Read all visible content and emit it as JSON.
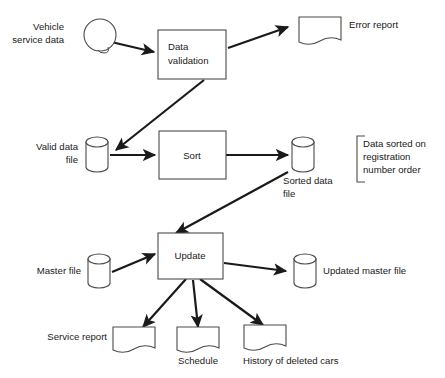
{
  "diagram": {
    "background_color": "#ffffff",
    "line_color": "#1a1a1a",
    "shape_outline_color": "#4a4a4a",
    "nodes": {
      "vehicle_service_data": {
        "label_line1": "Vehicle",
        "label_line2": "service data",
        "shape": "circle"
      },
      "data_validation": {
        "label_line1": "Data",
        "label_line2": "validation",
        "shape": "process-box"
      },
      "error_report": {
        "label": "Error report",
        "shape": "document"
      },
      "valid_data_file": {
        "label_line1": "Valid data",
        "label_line2": "file",
        "shape": "cylinder"
      },
      "sort": {
        "label": "Sort",
        "shape": "process-box"
      },
      "sorted_data_file": {
        "label_line1": "Sorted data",
        "label_line2": "file",
        "shape": "cylinder"
      },
      "annotation_sorted": {
        "label_line1": "Data sorted on",
        "label_line2": "registration",
        "label_line3": "number order",
        "shape": "bracket-note"
      },
      "master_file": {
        "label": "Master file",
        "shape": "cylinder"
      },
      "update": {
        "label": "Update",
        "shape": "process-box"
      },
      "updated_master_file": {
        "label": "Updated master file",
        "shape": "cylinder"
      },
      "service_report": {
        "label": "Service report",
        "shape": "document"
      },
      "schedule": {
        "label": "Schedule",
        "shape": "document"
      },
      "history_of_deleted_cars": {
        "label": "History of deleted cars",
        "shape": "document"
      }
    },
    "edges": [
      {
        "from": "vehicle_service_data",
        "to": "data_validation"
      },
      {
        "from": "data_validation",
        "to": "error_report"
      },
      {
        "from": "data_validation",
        "to": "valid_data_file"
      },
      {
        "from": "valid_data_file",
        "to": "sort"
      },
      {
        "from": "sort",
        "to": "sorted_data_file"
      },
      {
        "from": "sorted_data_file",
        "to": "update"
      },
      {
        "from": "master_file",
        "to": "update"
      },
      {
        "from": "update",
        "to": "updated_master_file"
      },
      {
        "from": "update",
        "to": "service_report"
      },
      {
        "from": "update",
        "to": "schedule"
      },
      {
        "from": "update",
        "to": "history_of_deleted_cars"
      }
    ]
  }
}
